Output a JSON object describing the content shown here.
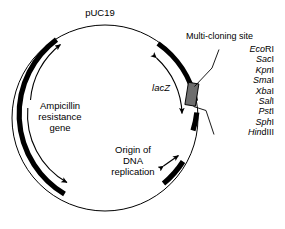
{
  "figure": {
    "title": "pUC19",
    "background_color": "#ffffff",
    "line_color": "#000000",
    "mcs_box_color": "#6e6e6e"
  },
  "plasmid": {
    "name": "pUC19",
    "features": [
      {
        "name": "Ampicillin resistance gene",
        "label_lines": [
          "Ampicillin",
          "resistance",
          "gene"
        ],
        "label_text": "Ampicillin\nresistance\ngene",
        "style": "thick-black-arc",
        "direction": "clockwise"
      },
      {
        "name": "Origin of DNA replication",
        "label_lines": [
          "Origin of",
          "DNA",
          "replication"
        ],
        "label_text": "Origin of\nDNA\nreplication",
        "style": "thick-black-arc",
        "direction": "bidirectional"
      },
      {
        "name": "lacZ",
        "label_text": "lacZ",
        "italic": true,
        "style": "thick-black-arc",
        "direction": "bidirectional"
      }
    ]
  },
  "mcs": {
    "title": "Multi-cloning site",
    "enzymes": [
      {
        "italic": "Eco",
        "roman": "RI",
        "full": "EcoRI"
      },
      {
        "italic": "Sac",
        "roman": "I",
        "full": "SacI"
      },
      {
        "italic": "Kpn",
        "roman": "I",
        "full": "KpnI"
      },
      {
        "italic": "Sma",
        "roman": "I",
        "full": "SmaI"
      },
      {
        "italic": "Xba",
        "roman": "I",
        "full": "XbaI"
      },
      {
        "italic": "Sal",
        "roman": "I",
        "full": "SalI"
      },
      {
        "italic": "Pst",
        "roman": "I",
        "full": "PstI"
      },
      {
        "italic": "Sph",
        "roman": "I",
        "full": "SphI"
      },
      {
        "italic": "Hin",
        "roman": "dIII",
        "full": "HindIII"
      }
    ]
  }
}
